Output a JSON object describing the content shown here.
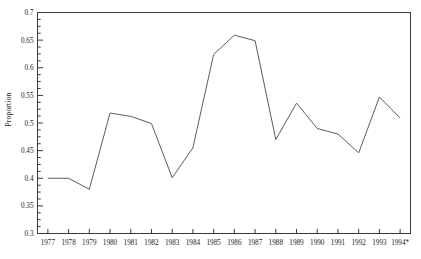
{
  "chart_data": {
    "type": "line",
    "title": "",
    "subtitle": "",
    "xlabel": "",
    "ylabel": "Proportion",
    "ylim": [
      0.3,
      0.7
    ],
    "grid": false,
    "legend": "none",
    "y_major_ticks": [
      0.3,
      0.35,
      0.4,
      0.45,
      0.5,
      0.55,
      0.6,
      0.65,
      0.7
    ],
    "y_tick_labels": [
      "0.3",
      "0.35",
      "0.4",
      "0.45",
      "0.5",
      "0.55",
      "0.6",
      "0.65",
      "0.7"
    ],
    "y_minor_step": 0.0125,
    "categories": [
      "1977",
      "1978",
      "1979",
      "1980",
      "1981",
      "1982",
      "1983",
      "1984",
      "1985",
      "1986",
      "1987",
      "1988",
      "1989",
      "1990",
      "1991",
      "1992",
      "1993",
      "1994*"
    ],
    "values": [
      0.4,
      0.4,
      0.38,
      0.518,
      0.512,
      0.499,
      0.401,
      0.455,
      0.624,
      0.659,
      0.649,
      0.47,
      0.536,
      0.49,
      0.48,
      0.446,
      0.547,
      0.509
    ],
    "series": [
      {
        "name": "Proportion",
        "values": [
          0.4,
          0.4,
          0.38,
          0.518,
          0.512,
          0.499,
          0.401,
          0.455,
          0.624,
          0.659,
          0.649,
          0.47,
          0.536,
          0.49,
          0.48,
          0.446,
          0.547,
          0.509
        ]
      }
    ],
    "annotations": [
      "* indicates provisional value for final year"
    ],
    "line_color": "#4a4a4a",
    "axis_color": "#3a3a3a",
    "background_color": "#ffffff"
  }
}
